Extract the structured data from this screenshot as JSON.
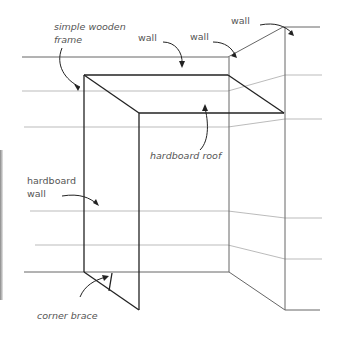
{
  "diagram": {
    "type": "illustration",
    "labels": {
      "frame": "simple wooden\nframe",
      "frame_line1": "simple wooden",
      "frame_line2": "frame",
      "wall_left": "wall",
      "wall_center": "wall",
      "wall_right": "wall",
      "roof": "hardboard roof",
      "hardboard_wall_line1": "hardboard",
      "hardboard_wall_line2": "wall",
      "brace": "corner brace"
    },
    "colors": {
      "frame_line": "#222222",
      "room_line": "#666666",
      "guide_line": "#aaaaaa",
      "label_text": "#555555",
      "background": "#ffffff"
    }
  }
}
